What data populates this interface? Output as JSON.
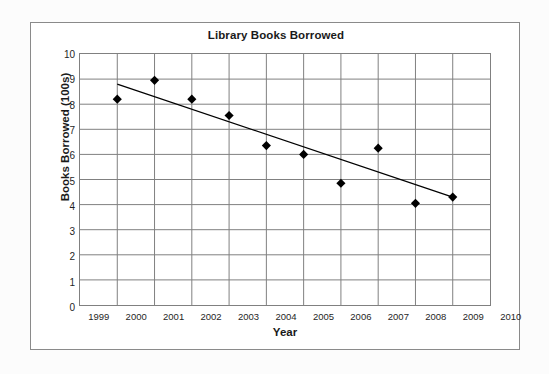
{
  "chart_data": {
    "type": "scatter",
    "title": "Library Books Borrowed",
    "xlabel": "Year",
    "ylabel": "Books Borrowed  (100s)",
    "x": [
      2000,
      2001,
      2002,
      2003,
      2004,
      2005,
      2006,
      2007,
      2008,
      2009
    ],
    "values": [
      8.2,
      8.95,
      8.2,
      7.55,
      6.35,
      6.0,
      4.85,
      6.25,
      4.05,
      4.3
    ],
    "series": [
      {
        "name": "Books Borrowed",
        "marker": "diamond",
        "color": "#000000",
        "values": [
          8.2,
          8.95,
          8.2,
          7.55,
          6.35,
          6.0,
          4.85,
          6.25,
          4.05,
          4.3
        ]
      }
    ],
    "trendline": {
      "name": "line of best fit",
      "color": "#000000",
      "x_start": 2000,
      "y_start": 8.8,
      "x_end": 2009,
      "y_end": 4.3
    },
    "xlim": [
      1999,
      2010
    ],
    "ylim": [
      0,
      10
    ],
    "xticks": [
      "1999",
      "2000",
      "2001",
      "2002",
      "2003",
      "2004",
      "2005",
      "2006",
      "2007",
      "2008",
      "2009",
      "2010"
    ],
    "xtick_values": [
      1999,
      2000,
      2001,
      2002,
      2003,
      2004,
      2005,
      2006,
      2007,
      2008,
      2009,
      2010
    ],
    "yticks": [
      "10",
      "9",
      "8",
      "7",
      "6",
      "5",
      "4",
      "3",
      "2",
      "1",
      "0"
    ],
    "ytick_values": [
      10,
      9,
      8,
      7,
      6,
      5,
      4,
      3,
      2,
      1,
      0
    ],
    "grid": true,
    "grid_color": "#808080",
    "legend": "none",
    "legend_position": "none",
    "plot_background": "#FFFFFF",
    "frame_color": "#8A8A8A"
  }
}
